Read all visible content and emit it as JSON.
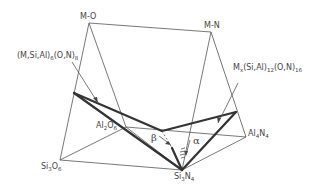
{
  "diagram": {
    "type": "phase-prism",
    "vertices": {
      "apex_left": {
        "label": "M-O"
      },
      "apex_right": {
        "label": "M-N"
      },
      "base_front_left": {
        "label_main": "Si",
        "sub1": "3",
        "label_mid": "O",
        "sub2": "6"
      },
      "base_front_right": {
        "label_main": "Si",
        "sub1": "3",
        "label_mid": "N",
        "sub2": "4"
      },
      "base_back_left": {
        "label_main": "Al",
        "sub1": "2",
        "label_mid": "O",
        "sub2": "6"
      },
      "base_back_right": {
        "label_main": "Al",
        "sub1": "4",
        "label_mid": "N",
        "sub2": "4"
      }
    },
    "phase_labels": {
      "beta_phase": {
        "pre": "(M,Si,Al)",
        "sub1": "6",
        "mid": "(O,N)",
        "sub2": "8"
      },
      "alpha_phase": {
        "pre": "M",
        "sub0": "x",
        "mid1": "(Si,Al)",
        "sub1": "12",
        "mid2": "(O,N)",
        "sub2": "16"
      }
    },
    "greek": {
      "beta": "β",
      "alpha": "α"
    }
  }
}
